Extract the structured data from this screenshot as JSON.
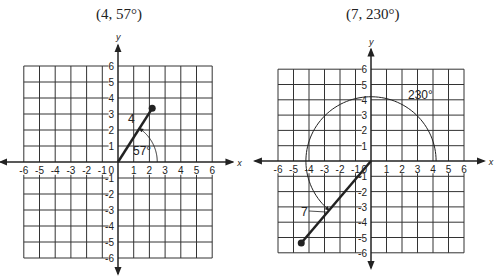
{
  "figures": [
    {
      "id": "left",
      "title": "(4, 57°)",
      "polar": {
        "r": 4,
        "theta_deg": 57
      },
      "radius_label": "4",
      "angle_label": "57°",
      "axes": {
        "x_label": "x",
        "y_label": "y",
        "range": [
          -6,
          6
        ]
      }
    },
    {
      "id": "right",
      "title": "(7, 230°)",
      "polar": {
        "r": 7,
        "theta_deg": 230
      },
      "radius_label": "7",
      "angle_label": "230°",
      "axes": {
        "x_label": "x",
        "y_label": "y",
        "range": [
          -6,
          6
        ]
      }
    }
  ],
  "ticks": {
    "x_neg": [
      "-6",
      "-5",
      "-4",
      "-3",
      "-2",
      "-1"
    ],
    "x_pos": [
      "1",
      "2",
      "3",
      "4",
      "5",
      "6"
    ],
    "y_pos": [
      "1",
      "2",
      "3",
      "4",
      "5",
      "6"
    ],
    "y_neg": [
      "-1",
      "-2",
      "-3",
      "-4",
      "-5",
      "-6"
    ],
    "origin": "0"
  },
  "colors": {
    "ink": "#222222",
    "grid": "#333333",
    "background": "#ffffff"
  }
}
